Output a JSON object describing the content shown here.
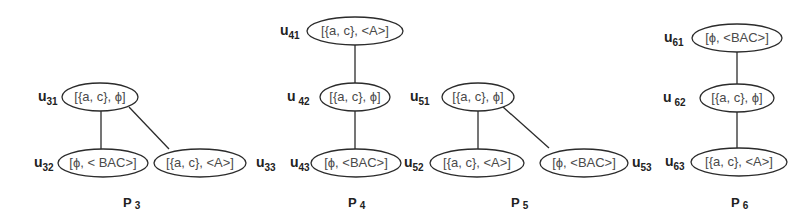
{
  "diagram": {
    "graphs": [
      {
        "id": "P3",
        "title": {
          "base": "P",
          "sub": "3"
        },
        "nodes": [
          {
            "id": "u31",
            "label": {
              "base": "u",
              "sub": "31"
            },
            "text": "[{a, c}, ϕ]"
          },
          {
            "id": "u32",
            "label": {
              "base": "u",
              "sub": "32"
            },
            "text": "[ϕ, < BAC>]"
          },
          {
            "id": "u33",
            "label": {
              "base": "u",
              "sub": "33"
            },
            "text": "[{a, c}, <A>]"
          }
        ],
        "edges": [
          [
            "u31",
            "u32"
          ],
          [
            "u31",
            "u33"
          ]
        ]
      },
      {
        "id": "P4",
        "title": {
          "base": "P",
          "sub": "4"
        },
        "nodes": [
          {
            "id": "u41",
            "label": {
              "base": "u",
              "sub": "41"
            },
            "text": "[{a, c}, <A>]"
          },
          {
            "id": "u42",
            "label": {
              "base": "u",
              "sub": "42"
            },
            "text": "[{a, c}, ϕ]"
          },
          {
            "id": "u43",
            "label": {
              "base": "u",
              "sub": "43"
            },
            "text": "[ϕ, <BAC>]"
          }
        ],
        "edges": [
          [
            "u41",
            "u42"
          ],
          [
            "u42",
            "u43"
          ]
        ]
      },
      {
        "id": "P5",
        "title": {
          "base": "P",
          "sub": "5"
        },
        "nodes": [
          {
            "id": "u51",
            "label": {
              "base": "u",
              "sub": "51"
            },
            "text": "[{a, c}, ϕ]"
          },
          {
            "id": "u52",
            "label": {
              "base": "u",
              "sub": "52"
            },
            "text": "[{a, c}, <A>]"
          },
          {
            "id": "u53",
            "label": {
              "base": "u",
              "sub": "53"
            },
            "text": "[ϕ, <BAC>]"
          }
        ],
        "edges": [
          [
            "u51",
            "u52"
          ],
          [
            "u51",
            "u53"
          ]
        ]
      },
      {
        "id": "P6",
        "title": {
          "base": "P",
          "sub": "6"
        },
        "nodes": [
          {
            "id": "u61",
            "label": {
              "base": "u",
              "sub": "61"
            },
            "text": "[ϕ, <BAC>]"
          },
          {
            "id": "u62",
            "label": {
              "base": "u",
              "sub": "62"
            },
            "text": "[{a, c}, ϕ]"
          },
          {
            "id": "u63",
            "label": {
              "base": "u",
              "sub": "63"
            },
            "text": "[{a, c}, <A>]"
          }
        ],
        "edges": [
          [
            "u61",
            "u62"
          ],
          [
            "u62",
            "u63"
          ]
        ]
      }
    ]
  }
}
